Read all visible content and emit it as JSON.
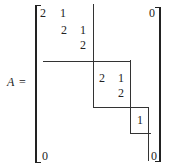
{
  "equation": {
    "lhs": "A",
    "equals": "="
  },
  "matrix": {
    "entries": [
      {
        "id": "b1-r1c1",
        "value": "2",
        "x": 40,
        "y": 7
      },
      {
        "id": "b1-r1c2",
        "value": "1",
        "x": 60,
        "y": 7
      },
      {
        "id": "b1-r2c2",
        "value": "2",
        "x": 61,
        "y": 24
      },
      {
        "id": "b1-r2c3",
        "value": "1",
        "x": 80,
        "y": 24
      },
      {
        "id": "b1-r3c3",
        "value": "2",
        "x": 80,
        "y": 39
      },
      {
        "id": "b2-r1c1",
        "value": "2",
        "x": 99,
        "y": 72
      },
      {
        "id": "b2-r1c2",
        "value": "1",
        "x": 118,
        "y": 72
      },
      {
        "id": "b2-r2c2",
        "value": "2",
        "x": 118,
        "y": 87
      },
      {
        "id": "b3-r1c1",
        "value": "1",
        "x": 137,
        "y": 114
      },
      {
        "id": "top-right-zero",
        "value": "0",
        "x": 151,
        "y": 7
      },
      {
        "id": "bottom-left-zero",
        "value": "0",
        "x": 42,
        "y": 150
      },
      {
        "id": "bottom-right-zero",
        "value": "0",
        "x": 155,
        "y": 150
      }
    ]
  }
}
